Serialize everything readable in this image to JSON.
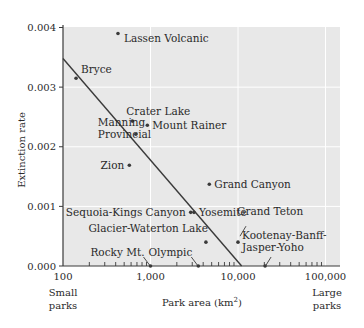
{
  "chart_data": {
    "type": "scatter",
    "title": "",
    "xlabel": "Park area (km²)",
    "xlabel_main": "Park area (km",
    "xlabel_sup": "2",
    "xlabel_close": ")",
    "ylabel": "Extinction rate",
    "x_scale": "log",
    "xlim": [
      100,
      140000
    ],
    "ylim": [
      0,
      0.004
    ],
    "x_ticks": [
      100,
      1000,
      10000,
      100000
    ],
    "x_tick_labels": [
      "100",
      "1,000",
      "10,000",
      "100,000"
    ],
    "y_ticks": [
      0,
      0.001,
      0.002,
      0.003,
      0.004
    ],
    "y_tick_labels": [
      "0.000",
      "0.001",
      "0.002",
      "0.003",
      "0.004"
    ],
    "grid": true,
    "annotations": {
      "left": [
        "Small",
        "parks"
      ],
      "right": [
        "Large",
        "parks"
      ]
    },
    "points": [
      {
        "name": "Lassen Volcanic",
        "x": 425,
        "y": 0.0039
      },
      {
        "name": "Bryce",
        "x": 141,
        "y": 0.00315
      },
      {
        "name": "Crater Lake",
        "x": 620,
        "y": 0.00243
      },
      {
        "name": "Mount Rainer",
        "x": 920,
        "y": 0.00236
      },
      {
        "name": "Manning Provincial",
        "x": 680,
        "y": 0.00221
      },
      {
        "name": "Zion",
        "x": 573,
        "y": 0.00169
      },
      {
        "name": "Grand Canyon",
        "x": 4700,
        "y": 0.00137
      },
      {
        "name": "Sequoia-Kings Canyon",
        "x": 2880,
        "y": 0.0009
      },
      {
        "name": "Yosemite",
        "x": 3140,
        "y": 0.0009
      },
      {
        "name": "Glacier-Waterton Lake",
        "x": 4300,
        "y": 0.0004
      },
      {
        "name": "Grand Teton",
        "x": 10000,
        "y": 0.0004
      },
      {
        "name": "Rocky Mt.",
        "x": 1000,
        "y": 0.0
      },
      {
        "name": "Olympic",
        "x": 3520,
        "y": 0.0
      },
      {
        "name": "Kootenay-Banff-Jasper-Yoho",
        "x": 20400,
        "y": 0.0
      }
    ],
    "regression_line": {
      "x": [
        100,
        11000
      ],
      "y": [
        0.00348,
        0.0
      ]
    },
    "colors": {
      "plot_bg": "#e8e8e8",
      "grid": "#ffffff",
      "ink": "#3a3a3a"
    }
  }
}
